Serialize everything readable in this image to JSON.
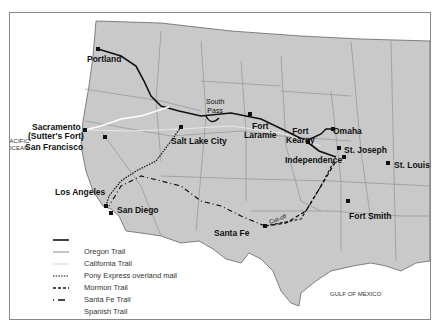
{
  "map": {
    "oceans": [
      {
        "name": "PACIFIC OCEAN",
        "lines": [
          "PACIFIC",
          "OCEAN"
        ]
      },
      {
        "name": "GULF OF MEXICO"
      }
    ],
    "cities": [
      {
        "name": "Portland"
      },
      {
        "name": "Sacramento"
      },
      {
        "name": "(Sutter's Fort)"
      },
      {
        "name": "San Francisco"
      },
      {
        "name": "Salt Lake City"
      },
      {
        "name": "Los Angeles"
      },
      {
        "name": "San Diego"
      },
      {
        "name": "South Pass",
        "lines": [
          "South",
          "Pass"
        ]
      },
      {
        "name": "Fort Laramie",
        "lines": [
          "Fort",
          "Laramie"
        ]
      },
      {
        "name": "Fort Kearny",
        "lines": [
          "Fort",
          "Kearny"
        ]
      },
      {
        "name": "Omaha"
      },
      {
        "name": "St. Joseph"
      },
      {
        "name": "Independence"
      },
      {
        "name": "St. Louis"
      },
      {
        "name": "Santa Fe"
      },
      {
        "name": "Fort Smith"
      }
    ],
    "annotations": [
      {
        "text": "Cut-off"
      }
    ],
    "legend": [
      {
        "label": "Oregon Trail",
        "style": "solid-black"
      },
      {
        "label": "California Trail",
        "style": "solid-white"
      },
      {
        "label": "Pony Express overland mail",
        "style": "solid-light-gray"
      },
      {
        "label": "Mormon Trail",
        "style": "dotted"
      },
      {
        "label": "Santa Fe Trail",
        "style": "dashed"
      },
      {
        "label": "Spanish Trail",
        "style": "dash-dot"
      }
    ],
    "colors": {
      "land": "#c9c9c9",
      "water": "#ffffff",
      "border": "#777777",
      "trail": "#111111"
    }
  }
}
